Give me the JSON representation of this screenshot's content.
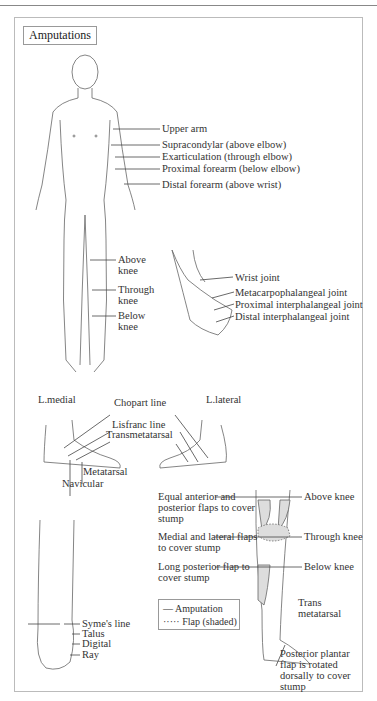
{
  "title": "Amputations",
  "upper_body_labels": [
    {
      "label": "Upper arm"
    },
    {
      "label": "Supracondylar (above elbow)"
    },
    {
      "label": "Exarticulation (through elbow)"
    },
    {
      "label": "Proximal forearm (below elbow)"
    },
    {
      "label": "Distal forearm (above wrist)"
    }
  ],
  "leg_labels": [
    {
      "label": "Above knee"
    },
    {
      "label": "Through knee"
    },
    {
      "label": "Below knee"
    }
  ],
  "hand_labels": [
    {
      "label": "Wrist joint"
    },
    {
      "label": "Metacarpophalangeal joint"
    },
    {
      "label": "Proximal interphalangeal joint"
    },
    {
      "label": "Distal interphalangeal joint"
    }
  ],
  "foot_section": {
    "medial_label": "L.medial",
    "lateral_label": "L.lateral",
    "lines": [
      "Chopart line",
      "Lisfranc line",
      "Transmetatarsal"
    ],
    "bones": [
      "Metatarsal",
      "Navicular"
    ]
  },
  "flap_section": {
    "flaps": [
      {
        "flap": "Equal anterior and posterior flaps to cover stump",
        "level": "Above knee"
      },
      {
        "flap": "Medial and lateral flaps to cover stump",
        "level": "Through knee"
      },
      {
        "flap": "Long posterior flap to cover stump",
        "level": "Below knee"
      }
    ],
    "trans_label": "Trans metatarsal",
    "plantar_note": "Posterior plantar flap is rotated dorsally to cover stump"
  },
  "ankle_labels": [
    "Syme's line",
    "Talus",
    "Digital",
    "Ray"
  ],
  "legend": {
    "items": [
      {
        "symbol": "—",
        "label": "Amputation"
      },
      {
        "symbol": "·····",
        "label": "Flap (shaded)"
      }
    ]
  },
  "colors": {
    "line": "#555555",
    "shade": "#d8d8d8",
    "text": "#333333"
  }
}
